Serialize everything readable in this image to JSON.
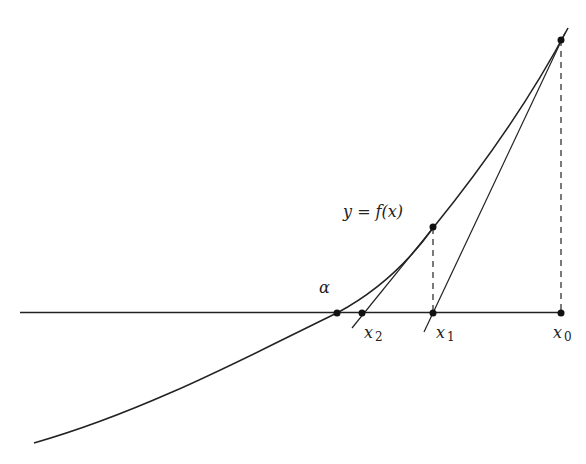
{
  "diagram": {
    "labels": {
      "curve": "y = f(x)",
      "root": "α",
      "x0": "x",
      "x0_sub": "0",
      "x1": "x",
      "x1_sub": "1",
      "x2": "x",
      "x2_sub": "2"
    },
    "colors": {
      "line": "#222222",
      "background": "#ffffff"
    }
  }
}
